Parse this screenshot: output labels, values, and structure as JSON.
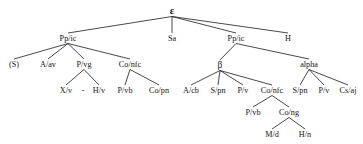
{
  "diagram": {
    "type": "syntax-tree",
    "title": "",
    "line_color": "#1a1a1a",
    "text_color": "#141414",
    "background": "#ffffff",
    "nodes": [
      {
        "id": "root",
        "label": "ε",
        "x": 172,
        "y": 14,
        "level": 0,
        "style": "root"
      },
      {
        "id": "ppic-l",
        "label": "Pp/ic",
        "x": 68,
        "y": 41,
        "level": 1,
        "style": "plain"
      },
      {
        "id": "sa",
        "label": "Sa",
        "x": 172,
        "y": 41,
        "level": 1,
        "style": "plain"
      },
      {
        "id": "ppic-r",
        "label": "Pp/ic",
        "x": 236,
        "y": 41,
        "level": 1,
        "style": "plain"
      },
      {
        "id": "h",
        "label": "H",
        "x": 288,
        "y": 41,
        "level": 1,
        "style": "plain"
      },
      {
        "id": "s-paren",
        "label": "(S)",
        "x": 14,
        "y": 67,
        "level": 2,
        "style": "plain"
      },
      {
        "id": "a-av",
        "label": "A/av",
        "x": 48,
        "y": 67,
        "level": 2,
        "style": "plain"
      },
      {
        "id": "p-vg",
        "label": "P/vg",
        "x": 84,
        "y": 67,
        "level": 2,
        "style": "plain"
      },
      {
        "id": "co-nfc-l",
        "label": "Co/nfc",
        "x": 130,
        "y": 67,
        "level": 2,
        "style": "plain"
      },
      {
        "id": "beta",
        "label": "β",
        "x": 220,
        "y": 68,
        "level": 2,
        "style": "greek"
      },
      {
        "id": "alpha",
        "label": "alpha",
        "x": 309,
        "y": 67,
        "level": 2,
        "style": "plain"
      },
      {
        "id": "x-v",
        "label": "X/v",
        "x": 66,
        "y": 93,
        "level": 3,
        "style": "plain"
      },
      {
        "id": "h-v",
        "label": "H/v",
        "x": 99,
        "y": 93,
        "level": 3,
        "style": "plain"
      },
      {
        "id": "p-vb-l",
        "label": "P/vb",
        "x": 125,
        "y": 93,
        "level": 3,
        "style": "plain"
      },
      {
        "id": "co-pn",
        "label": "Co/pn",
        "x": 159,
        "y": 93,
        "level": 3,
        "style": "plain"
      },
      {
        "id": "a-cb",
        "label": "A/cb",
        "x": 191,
        "y": 93,
        "level": 3,
        "style": "plain"
      },
      {
        "id": "s-pn-1",
        "label": "S/pn",
        "x": 218,
        "y": 93,
        "level": 3,
        "style": "plain"
      },
      {
        "id": "p-v-1",
        "label": "P/v",
        "x": 243,
        "y": 93,
        "level": 3,
        "style": "plain"
      },
      {
        "id": "co-nfc-r",
        "label": "Co/nfc",
        "x": 272,
        "y": 93,
        "level": 3,
        "style": "plain"
      },
      {
        "id": "s-pn-2",
        "label": "S/pn",
        "x": 300,
        "y": 93,
        "level": 3,
        "style": "plain"
      },
      {
        "id": "p-v-2",
        "label": "P/v",
        "x": 324,
        "y": 93,
        "level": 3,
        "style": "plain"
      },
      {
        "id": "cs-aj",
        "label": "Cs/aj",
        "x": 348,
        "y": 93,
        "level": 3,
        "style": "plain"
      },
      {
        "id": "p-vb-r",
        "label": "P/vb",
        "x": 253,
        "y": 115,
        "level": 4,
        "style": "plain"
      },
      {
        "id": "co-ng",
        "label": "Co/ng",
        "x": 289,
        "y": 115,
        "level": 4,
        "style": "plain"
      },
      {
        "id": "m-d",
        "label": "M/d",
        "x": 272,
        "y": 137,
        "level": 5,
        "style": "plain"
      },
      {
        "id": "h-n",
        "label": "H/n",
        "x": 305,
        "y": 137,
        "level": 5,
        "style": "plain"
      }
    ],
    "edges": [
      {
        "from": "root",
        "to": "ppic-l"
      },
      {
        "from": "root",
        "to": "sa"
      },
      {
        "from": "root",
        "to": "ppic-r"
      },
      {
        "from": "root",
        "to": "h"
      },
      {
        "from": "ppic-l",
        "to": "s-paren"
      },
      {
        "from": "ppic-l",
        "to": "a-av"
      },
      {
        "from": "ppic-l",
        "to": "p-vg"
      },
      {
        "from": "ppic-l",
        "to": "co-nfc-l"
      },
      {
        "from": "ppic-r",
        "to": "beta"
      },
      {
        "from": "ppic-r",
        "to": "alpha"
      },
      {
        "from": "p-vg",
        "to": "x-v"
      },
      {
        "from": "p-vg",
        "to": "h-v"
      },
      {
        "from": "co-nfc-l",
        "to": "p-vb-l"
      },
      {
        "from": "co-nfc-l",
        "to": "co-pn"
      },
      {
        "from": "beta",
        "to": "a-cb"
      },
      {
        "from": "beta",
        "to": "s-pn-1"
      },
      {
        "from": "beta",
        "to": "p-v-1"
      },
      {
        "from": "beta",
        "to": "co-nfc-r"
      },
      {
        "from": "alpha",
        "to": "s-pn-2"
      },
      {
        "from": "alpha",
        "to": "p-v-2"
      },
      {
        "from": "alpha",
        "to": "cs-aj"
      },
      {
        "from": "co-nfc-r",
        "to": "p-vb-r"
      },
      {
        "from": "co-nfc-r",
        "to": "co-ng"
      },
      {
        "from": "co-ng",
        "to": "m-d"
      },
      {
        "from": "co-ng",
        "to": "h-n"
      }
    ],
    "separators": [
      {
        "id": "sep-xv-hv",
        "label": "-",
        "x": 83,
        "y": 93
      }
    ]
  }
}
